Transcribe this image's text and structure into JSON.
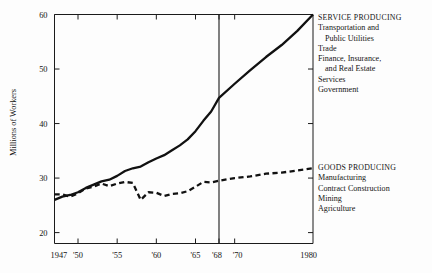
{
  "chart_data": {
    "type": "line",
    "title": "",
    "xlabel": "",
    "ylabel": "Millions of Workers",
    "xlim": [
      1947,
      1980
    ],
    "ylim": [
      18,
      60
    ],
    "grid": false,
    "legend_position": "right",
    "xticks": [
      1947,
      1950,
      1955,
      1960,
      1965,
      1968,
      1970,
      1980
    ],
    "xticklabels": [
      "1947",
      "'50",
      "'55",
      "'60",
      "'65",
      "'68",
      "'70",
      "1980"
    ],
    "yticks": [
      20,
      30,
      40,
      50,
      60
    ],
    "yticklabels": [
      "20",
      "30",
      "40",
      "50",
      "60"
    ],
    "annotations": [
      {
        "type": "vertical-reference-line",
        "x": 1968,
        "label": "'68"
      }
    ],
    "series": [
      {
        "name": "SERVICE PRODUCING",
        "style": "solid",
        "color": "#111111",
        "x": [
          1947,
          1948,
          1949,
          1950,
          1951,
          1952,
          1953,
          1954,
          1955,
          1956,
          1957,
          1958,
          1959,
          1960,
          1961,
          1962,
          1963,
          1964,
          1965,
          1966,
          1967,
          1968,
          1970,
          1972,
          1974,
          1976,
          1978,
          1980
        ],
        "values": [
          26.0,
          26.6,
          26.9,
          27.4,
          28.2,
          28.8,
          29.4,
          29.7,
          30.4,
          31.3,
          31.8,
          32.1,
          32.9,
          33.6,
          34.2,
          35.1,
          36.0,
          37.1,
          38.6,
          40.5,
          42.2,
          44.7,
          47.3,
          49.8,
          52.2,
          54.4,
          57.0,
          60.0
        ]
      },
      {
        "name": "GOODS PRODUCING",
        "style": "dashed",
        "color": "#111111",
        "x": [
          1947,
          1948,
          1949,
          1950,
          1951,
          1952,
          1953,
          1954,
          1955,
          1956,
          1957,
          1958,
          1959,
          1960,
          1961,
          1962,
          1963,
          1964,
          1965,
          1966,
          1967,
          1968,
          1970,
          1972,
          1974,
          1976,
          1978,
          1980
        ],
        "values": [
          27.0,
          27.0,
          26.6,
          27.2,
          28.1,
          28.4,
          29.0,
          28.5,
          29.0,
          29.3,
          29.1,
          26.0,
          27.4,
          27.3,
          26.7,
          27.1,
          27.2,
          27.6,
          28.4,
          29.3,
          29.2,
          29.5,
          30.0,
          30.3,
          30.8,
          31.0,
          31.4,
          31.8
        ]
      }
    ]
  },
  "legends": {
    "service": {
      "heading": "SERVICE PRODUCING",
      "items": [
        {
          "text": "Transportation and",
          "indent": false
        },
        {
          "text": "Public Utilities",
          "indent": true
        },
        {
          "text": "Trade",
          "indent": false
        },
        {
          "text": "Finance, Insurance,",
          "indent": false
        },
        {
          "text": "and Real Estate",
          "indent": true
        },
        {
          "text": "Services",
          "indent": false
        },
        {
          "text": "Government",
          "indent": false
        }
      ]
    },
    "goods": {
      "heading": "GOODS PRODUCING",
      "items": [
        {
          "text": "Manufacturing",
          "indent": false
        },
        {
          "text": "Contract Construction",
          "indent": false
        },
        {
          "text": "Mining",
          "indent": false
        },
        {
          "text": "Agriculture",
          "indent": false
        }
      ]
    }
  }
}
